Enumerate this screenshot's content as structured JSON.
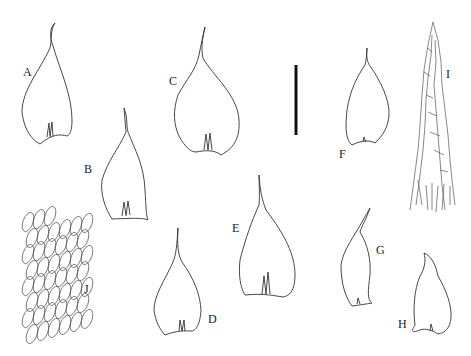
{
  "figure": {
    "panels": [
      {
        "id": "A",
        "label": "A",
        "type": "leaf"
      },
      {
        "id": "B",
        "label": "B",
        "type": "leaf"
      },
      {
        "id": "C",
        "label": "C",
        "type": "leaf"
      },
      {
        "id": "D",
        "label": "D",
        "type": "leaf"
      },
      {
        "id": "E",
        "label": "E",
        "type": "leaf"
      },
      {
        "id": "F",
        "label": "F",
        "type": "leaf"
      },
      {
        "id": "G",
        "label": "G",
        "type": "leaf"
      },
      {
        "id": "H",
        "label": "H",
        "type": "leaf"
      },
      {
        "id": "I",
        "label": "I",
        "type": "apical-cells"
      },
      {
        "id": "J",
        "label": "J",
        "type": "laminal-cells"
      }
    ],
    "scale_bar": {
      "color": "#111"
    }
  }
}
